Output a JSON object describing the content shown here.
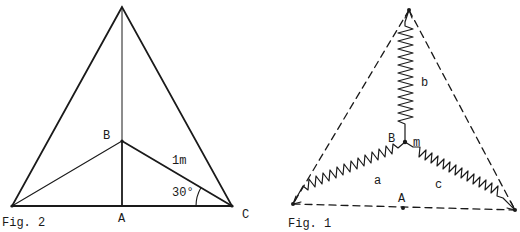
{
  "figures": [
    {
      "id": "fig2",
      "caption": "Fig. 2",
      "labels": {
        "B": "B",
        "A": "A",
        "C": "C",
        "length": "1m",
        "angle": "30°"
      },
      "description": "Isosceles triangle with vertical median from apex to base midpoint A; point B on median connected to both base vertices; segment BC = 1m, angle BCA = 30°"
    },
    {
      "id": "fig1",
      "caption": "Fig. 1",
      "labels": {
        "B": "B",
        "m": "m",
        "A": "A",
        "a": "a",
        "b": "b",
        "c": "c"
      },
      "description": "Dashed equilateral-like triangle with three springs a, b, c joining a central mass m at point B to the three vertices; point A at midpoint of base"
    }
  ],
  "colors": {
    "ink": "#1a1a1a",
    "background": "#ffffff"
  }
}
